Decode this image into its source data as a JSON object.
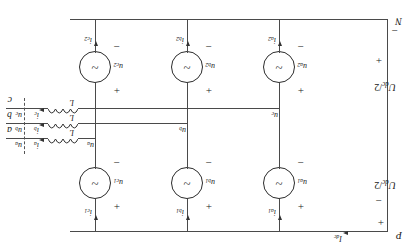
{
  "diagram": {
    "type": "three-phase-converter-schematic",
    "orientation_note": "rotated-180",
    "rails": {
      "top_node": "N",
      "bottom_node": "P",
      "top_sign": "−",
      "bottom_sign": "+",
      "dc_current": "I",
      "dc_current_sub": "dc"
    },
    "dc_sources": [
      {
        "label": "U",
        "sub": "dc",
        "suffix": "/2",
        "plus": "+",
        "minus": "−"
      },
      {
        "label": "U",
        "sub": "dc",
        "suffix": "/2",
        "plus": "+",
        "minus": "−"
      }
    ],
    "upper_arm_sources": [
      {
        "voltage": "u",
        "voltage_sub": "a2",
        "current": "i",
        "current_sub": "a2",
        "plus": "+",
        "minus": "−",
        "symbol": "~"
      },
      {
        "voltage": "u",
        "voltage_sub": "b2",
        "current": "i",
        "current_sub": "b2",
        "plus": "+",
        "minus": "−",
        "symbol": "~"
      },
      {
        "voltage": "u",
        "voltage_sub": "c2",
        "current": "i",
        "current_sub": "c2",
        "plus": "+",
        "minus": "−",
        "symbol": "~"
      }
    ],
    "lower_arm_sources": [
      {
        "voltage": "u",
        "voltage_sub": "a1",
        "current": "i",
        "current_sub": "a1",
        "plus": "+",
        "minus": "−",
        "symbol": "~"
      },
      {
        "voltage": "u",
        "voltage_sub": "b1",
        "current": "i",
        "current_sub": "b1",
        "plus": "+",
        "minus": "−",
        "symbol": "~"
      },
      {
        "voltage": "u",
        "voltage_sub": "c1",
        "current": "i",
        "current_sub": "c1",
        "plus": "+",
        "minus": "−",
        "symbol": "~"
      }
    ],
    "mid_nodes": [
      {
        "label": "u",
        "sub": "c"
      },
      {
        "label": "u",
        "sub": "b"
      },
      {
        "label": "u",
        "sub": "a"
      }
    ],
    "inductors": [
      {
        "label": "L",
        "current": "i",
        "current_sub": "c",
        "terminal": "c",
        "terminal_voltage": "u",
        "terminal_voltage_sub": "c"
      },
      {
        "label": "L",
        "current": "i",
        "current_sub": "b",
        "terminal": "b",
        "terminal_voltage": "u",
        "terminal_voltage_sub": "b"
      },
      {
        "label": "L",
        "current": "i",
        "current_sub": "a",
        "terminal": "a",
        "terminal_voltage": "u",
        "terminal_voltage_sub": "a"
      }
    ]
  }
}
